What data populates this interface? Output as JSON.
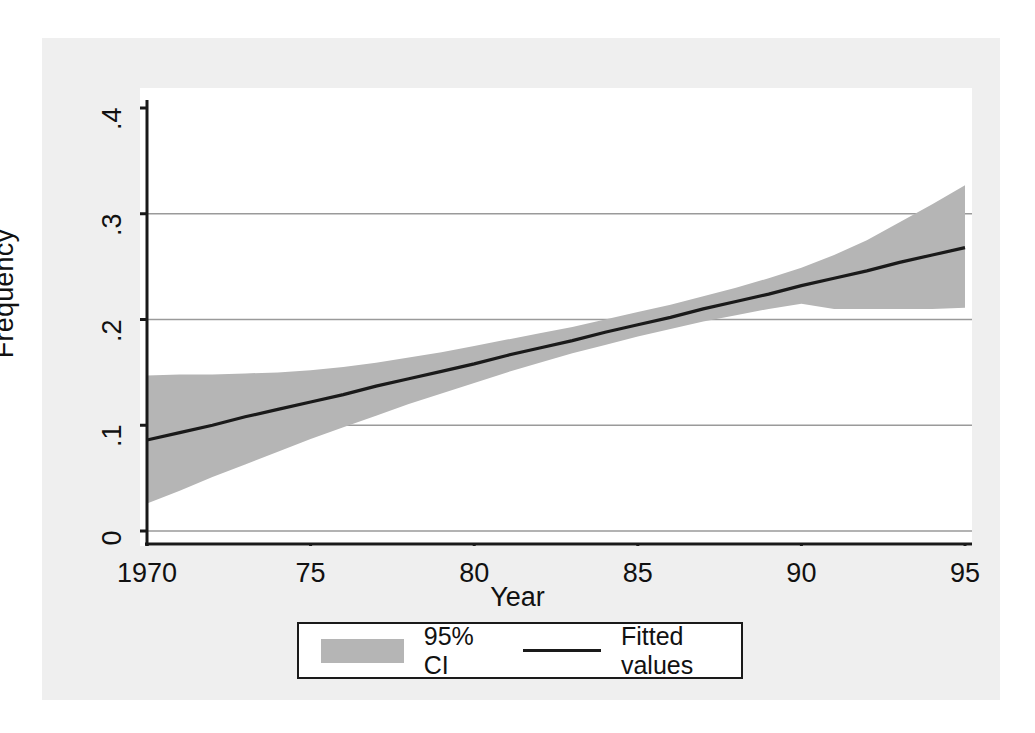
{
  "chart_data": {
    "type": "area",
    "title": "",
    "subtitle": "",
    "xlabel": "Year",
    "ylabel": "Frequency",
    "xlim": [
      1970,
      1995
    ],
    "ylim": [
      0,
      0.4
    ],
    "grid": "horizontal",
    "legend_position": "bottom-center",
    "x_ticks": [
      1970,
      1975,
      1980,
      1985,
      1990,
      1995
    ],
    "x_tick_labels": [
      "1970",
      "75",
      "80",
      "85",
      "90",
      "95"
    ],
    "y_ticks": [
      0,
      0.1,
      0.2,
      0.3,
      0.4
    ],
    "y_tick_labels": [
      "0",
      ".1",
      ".2",
      ".3",
      ".4"
    ],
    "x": [
      1970,
      1971,
      1972,
      1973,
      1974,
      1975,
      1976,
      1977,
      1978,
      1979,
      1980,
      1981,
      1982,
      1983,
      1984,
      1985,
      1986,
      1987,
      1988,
      1989,
      1990,
      1991,
      1992,
      1993,
      1994,
      1995
    ],
    "series": [
      {
        "name": "Fitted values",
        "type": "line",
        "color": "#1a1a1a",
        "values": [
          0.086,
          0.093,
          0.1,
          0.108,
          0.115,
          0.122,
          0.129,
          0.137,
          0.144,
          0.151,
          0.158,
          0.166,
          0.173,
          0.18,
          0.188,
          0.195,
          0.202,
          0.21,
          0.217,
          0.224,
          0.232,
          0.239,
          0.246,
          0.254,
          0.261,
          0.268
        ]
      },
      {
        "name": "95% CI",
        "type": "band",
        "color": "#b5b5b5",
        "upper": [
          0.147,
          0.148,
          0.148,
          0.149,
          0.15,
          0.152,
          0.155,
          0.159,
          0.164,
          0.169,
          0.175,
          0.181,
          0.187,
          0.193,
          0.2,
          0.207,
          0.214,
          0.222,
          0.23,
          0.239,
          0.249,
          0.261,
          0.275,
          0.292,
          0.309,
          0.327
        ],
        "lower": [
          0.026,
          0.038,
          0.051,
          0.063,
          0.075,
          0.087,
          0.098,
          0.109,
          0.12,
          0.13,
          0.14,
          0.15,
          0.159,
          0.168,
          0.176,
          0.184,
          0.191,
          0.198,
          0.204,
          0.21,
          0.215,
          0.21,
          0.21,
          0.21,
          0.21,
          0.211
        ]
      }
    ],
    "legend_entries": [
      {
        "label": "95% CI",
        "marker": "swatch",
        "color": "#b5b5b5"
      },
      {
        "label": "Fitted values",
        "marker": "line",
        "color": "#1a1a1a"
      }
    ]
  },
  "axes": {
    "y_title": "Frequency",
    "x_title": "Year",
    "y_tick_labels": [
      "0",
      ".1",
      ".2",
      ".3",
      ".4"
    ],
    "x_tick_labels": [
      "1970",
      "75",
      "80",
      "85",
      "90",
      "95"
    ]
  },
  "legend": {
    "ci_label": "95% CI",
    "fitted_label": "Fitted values"
  },
  "colors": {
    "band": "#b5b5b5",
    "line": "#1a1a1a",
    "grid": "#9a9a9a",
    "axis": "#1a1a1a",
    "backdrop": "#efefef",
    "plot_background": "#ffffff"
  }
}
